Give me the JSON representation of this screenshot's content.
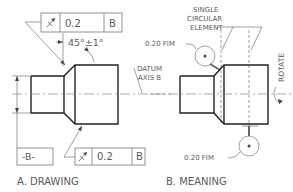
{
  "figure": {
    "panel_a": {
      "caption": "A. DRAWING",
      "fcf_top": {
        "symbol": "circular-runout-arrow",
        "tolerance": "0.2",
        "datum": "B"
      },
      "angle_dim": "45°±1°",
      "datum_label": "DATUM",
      "datum_label2": "AXIS B",
      "datum_feature": "-B-",
      "fcf_bottom": {
        "symbol": "circular-runout-arrow",
        "tolerance": "0.2",
        "datum": "B"
      }
    },
    "panel_b": {
      "caption": "B. MEANING",
      "element_note_1": "SINGLE",
      "element_note_2": "CIRCULAR",
      "element_note_3": "ELEMENT",
      "fim_top": "0.20 FIM",
      "fim_bottom": "0.20 FIM",
      "rotate_label": "ROTATE"
    }
  }
}
